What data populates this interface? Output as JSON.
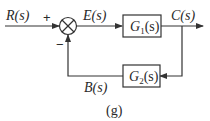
{
  "diagram": {
    "type": "feedback-control-block-diagram",
    "caption": "(g)",
    "signals": {
      "input": "R(s)",
      "error": "E(s)",
      "output": "C(s)",
      "feedback": "B(s)"
    },
    "summing_junction": {
      "plus_sign": "+",
      "minus_sign": "−"
    },
    "blocks": [
      {
        "id": "G1",
        "name": "G",
        "subscript": "1",
        "arg": "(s)",
        "path": "forward"
      },
      {
        "id": "G2",
        "name": "G",
        "subscript": "2",
        "arg": "(s)",
        "path": "feedback"
      }
    ],
    "colors": {
      "line": "#333333",
      "text": "#2a2a2a",
      "background": "#ffffff"
    }
  }
}
